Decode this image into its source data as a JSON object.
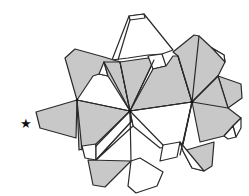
{
  "figure": {
    "colors": {
      "shaded_face": "#c8c8c8",
      "white_face": "#ffffff",
      "edge": "#2a2a2a",
      "background": "#ffffff"
    },
    "marker": {
      "glyph": "★",
      "position": "left of figure, mid-height"
    }
  }
}
